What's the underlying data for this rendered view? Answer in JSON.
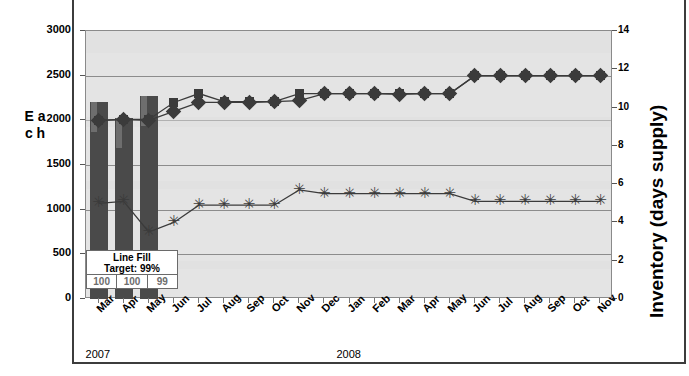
{
  "chart_data": {
    "type": "line",
    "title": "",
    "xlabel": "",
    "ylabel": "E a c h",
    "ylabel_right": "Inventory (days supply)",
    "ylim": [
      0,
      3000
    ],
    "ytick_labels": [
      "3000",
      "2500",
      "2000",
      "1500",
      "1000",
      "500",
      "0"
    ],
    "ylim_right": [
      0,
      14
    ],
    "ytick_labels_right": [
      "14",
      "12",
      "10",
      "8",
      "6",
      "4",
      "2",
      "0"
    ],
    "grid": true,
    "legend_position": "none",
    "categories": [
      "Mar",
      "Apr",
      "May",
      "Jun",
      "Jul",
      "Aug",
      "Sep",
      "Oct",
      "Nov",
      "Dec",
      "Jan",
      "Feb",
      "Mar",
      "Apr",
      "May",
      "Jun",
      "Jul",
      "Aug",
      "Sep",
      "Oct",
      "Nov"
    ],
    "year_labels": [
      {
        "text": "2007",
        "at_category": "Mar"
      },
      {
        "text": "2008",
        "at_category": "Jan"
      }
    ],
    "series": [
      {
        "name": "Demand (bars)",
        "type": "bar",
        "axis": "left",
        "marker": "bar",
        "values": [
          2200,
          2030,
          2270,
          null,
          null,
          null,
          null,
          null,
          null,
          null,
          null,
          null,
          null,
          null,
          null,
          null,
          null,
          null,
          null,
          null,
          null
        ]
      },
      {
        "name": "Forecast (squares)",
        "type": "line",
        "axis": "left",
        "marker": "square",
        "values": [
          2000,
          2010,
          2010,
          2200,
          2300,
          2210,
          2210,
          2210,
          2300,
          2300,
          2300,
          2300,
          2300,
          2300,
          2300,
          2500,
          2500,
          2500,
          2500,
          2500,
          2500
        ]
      },
      {
        "name": "Inventory plan (diamonds)",
        "type": "line",
        "axis": "left",
        "marker": "diamond",
        "values": [
          2000,
          2010,
          2000,
          2100,
          2200,
          2200,
          2200,
          2210,
          2220,
          2300,
          2300,
          2300,
          2290,
          2300,
          2300,
          2500,
          2500,
          2500,
          2500,
          2500,
          2500
        ]
      },
      {
        "name": "Inventory (days supply)",
        "type": "line",
        "axis": "right",
        "marker": "star",
        "values": [
          5.0,
          5.1,
          3.5,
          4.0,
          4.9,
          4.9,
          4.9,
          4.9,
          5.7,
          5.5,
          5.5,
          5.5,
          5.5,
          5.5,
          5.5,
          5.1,
          5.1,
          5.1,
          5.1,
          5.1,
          5.1
        ]
      }
    ],
    "annotations": {
      "line_fill": {
        "title_line1": "Line Fill",
        "title_line2": "Target: 99%",
        "values": [
          "100",
          "100",
          "99"
        ]
      }
    }
  }
}
